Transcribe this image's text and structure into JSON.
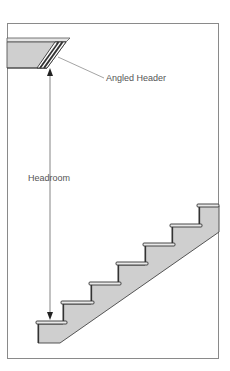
{
  "diagram": {
    "labels": {
      "angled_header": "Angled Header",
      "headroom": "Headroom"
    },
    "colors": {
      "line": "#555555",
      "fill": "#cfcfcf",
      "frame": "#888888",
      "background": "#ffffff"
    },
    "steps": [
      {
        "x": 36,
        "y": 321
      },
      {
        "x": 63,
        "y": 301
      },
      {
        "x": 91,
        "y": 282
      },
      {
        "x": 118,
        "y": 262
      },
      {
        "x": 145,
        "y": 243
      },
      {
        "x": 172,
        "y": 224
      },
      {
        "x": 199,
        "y": 204
      }
    ]
  }
}
